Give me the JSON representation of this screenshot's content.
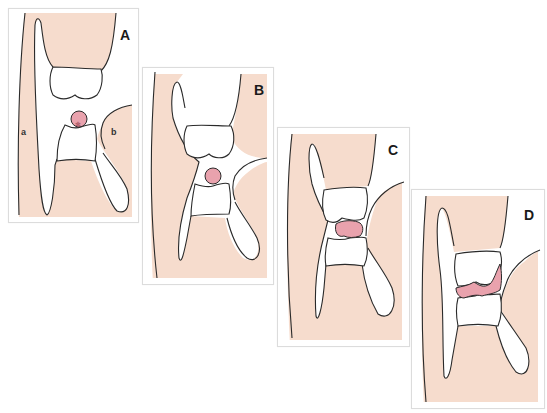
{
  "figure": {
    "colors": {
      "tissue": "#f6dccd",
      "outline": "#2a2a2a",
      "fluid": "#e9a2ad",
      "frame": "#dcdcdc",
      "background": "#ffffff"
    },
    "panels": [
      {
        "id": "A",
        "label": "A",
        "regions": [
          {
            "label": "a"
          },
          {
            "label": "b"
          }
        ],
        "center_marker": "✻",
        "lesion_shape": "circle"
      },
      {
        "id": "B",
        "label": "B",
        "lesion_shape": "circle"
      },
      {
        "id": "C",
        "label": "C",
        "lesion_shape": "flattened-oval"
      },
      {
        "id": "D",
        "label": "D",
        "lesion_shape": "thin-band"
      }
    ]
  }
}
